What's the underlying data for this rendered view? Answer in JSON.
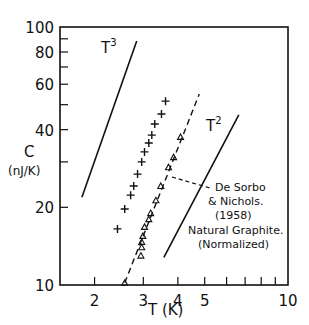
{
  "chart_data": {
    "type": "scatter",
    "title": "",
    "xlabel": "T (K)",
    "ylabel": "C (nJ/K)",
    "ylabel_line1": "C",
    "ylabel_line2": "(nJ/K)",
    "xscale": "log",
    "yscale": "log",
    "xlim": [
      1.5,
      10
    ],
    "ylim": [
      10,
      100
    ],
    "grid": false,
    "x_ticks_labeled": [
      {
        "value": 2,
        "label": "2"
      },
      {
        "value": 3,
        "label": "3"
      },
      {
        "value": 4,
        "label": "4"
      },
      {
        "value": 5,
        "label": "5"
      },
      {
        "value": 10,
        "label": "10"
      }
    ],
    "x_ticks_minor": [
      6,
      7,
      8,
      9
    ],
    "y_ticks_labeled": [
      {
        "value": 10,
        "label": "10"
      },
      {
        "value": 20,
        "label": "20"
      },
      {
        "value": 40,
        "label": "40"
      },
      {
        "value": 60,
        "label": "60"
      },
      {
        "value": 80,
        "label": "80"
      },
      {
        "value": 100,
        "label": "100"
      }
    ],
    "y_ticks_minor": [
      30,
      50,
      70,
      90
    ],
    "series": [
      {
        "name": "cross",
        "marker": "+",
        "x": [
          2.42,
          2.57,
          2.7,
          2.77,
          2.86,
          2.96,
          3.03,
          3.14,
          3.22,
          3.3,
          3.49,
          3.61
        ],
        "y": [
          16.5,
          19.7,
          22.3,
          24.2,
          26.9,
          30.0,
          32.8,
          35.5,
          38.1,
          42.1,
          46.0,
          51.6
        ]
      },
      {
        "name": "triangle",
        "marker": "triangle",
        "x": [
          2.57,
          2.94,
          2.96,
          2.96,
          2.99,
          3.03,
          3.14,
          3.19,
          3.33,
          3.47,
          3.7,
          3.86,
          4.09
        ],
        "y": [
          10.2,
          13.0,
          14.0,
          14.7,
          15.5,
          16.8,
          18.0,
          19.0,
          21.3,
          24.2,
          28.6,
          31.3,
          37.5
        ]
      },
      {
        "name": "De Sorbo & Nichols (1958) Natural Graphite (Normalized)",
        "style": "dashed-line",
        "x": [
          2.57,
          4.78
        ],
        "y": [
          10.2,
          55.0
        ]
      },
      {
        "name": "T^3 reference",
        "style": "solid-line",
        "x": [
          1.8,
          2.84
        ],
        "y": [
          21.9,
          88.3
        ]
      },
      {
        "name": "T^2 reference",
        "style": "solid-line",
        "x": [
          3.56,
          6.64
        ],
        "y": [
          12.8,
          45.6
        ]
      }
    ],
    "annotations": [
      {
        "text": "T",
        "sup": "3",
        "x": 2.2,
        "y": 78
      },
      {
        "text": "T",
        "sup": "2",
        "x": 4.5,
        "y": 38
      },
      {
        "lines": [
          "De Sorbo",
          "& Nichols.",
          "(1958)",
          "Natural Graphite.",
          "(Normalized)"
        ],
        "leader_from": {
          "x": 3.7,
          "y": 26.5
        }
      }
    ]
  }
}
